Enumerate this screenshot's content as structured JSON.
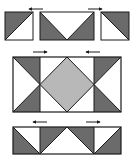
{
  "diagram": {
    "colors": {
      "background": "#ffffff",
      "dark": "#6b6b6b",
      "medium": "#b8b8b8",
      "light": "#ffffff",
      "outline": "#1a1a1a"
    },
    "rows": [
      {
        "name": "top-row",
        "units": [
          {
            "name": "half-square-triangle-left",
            "x": 5,
            "y": 12,
            "w": 28,
            "h": 28
          },
          {
            "name": "flying-geese-inverted",
            "x": 40,
            "y": 12,
            "w": 54,
            "h": 28
          },
          {
            "name": "half-square-triangle-right",
            "x": 101,
            "y": 12,
            "w": 28,
            "h": 28
          }
        ],
        "arrows": [
          {
            "name": "arrow-left",
            "direction": "left",
            "x1": 43,
            "x2": 29,
            "y": 9
          },
          {
            "name": "arrow-right",
            "direction": "right",
            "x1": 88,
            "x2": 102,
            "y": 9
          }
        ]
      },
      {
        "name": "middle-row",
        "units": [
          {
            "name": "left-hourglass-half",
            "x": 13,
            "y": 57,
            "w": 27,
            "h": 55
          },
          {
            "name": "center-square-in-square",
            "x": 40,
            "y": 57,
            "w": 54,
            "h": 55
          },
          {
            "name": "right-hourglass-half",
            "x": 94,
            "y": 57,
            "w": 27,
            "h": 55
          }
        ],
        "arrows": [
          {
            "name": "arrow-right",
            "direction": "right",
            "x1": 33,
            "x2": 47,
            "y": 52
          },
          {
            "name": "arrow-left",
            "direction": "left",
            "x1": 100,
            "x2": 86,
            "y": 52
          }
        ]
      },
      {
        "name": "bottom-row",
        "units": [
          {
            "name": "bottom-triangle-strip",
            "x": 13,
            "y": 127,
            "w": 108,
            "h": 27
          }
        ],
        "arrows": [
          {
            "name": "arrow-left",
            "direction": "left",
            "x1": 47,
            "x2": 33,
            "y": 122
          },
          {
            "name": "arrow-right",
            "direction": "right",
            "x1": 86,
            "x2": 100,
            "y": 122
          }
        ]
      }
    ]
  }
}
